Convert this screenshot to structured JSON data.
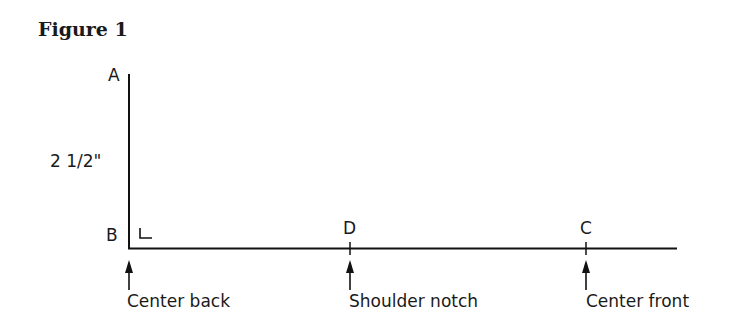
{
  "figure": {
    "title": "Figure 1",
    "points": {
      "a": "A",
      "b": "B",
      "c": "C",
      "d": "D"
    },
    "measurement": "2 1/2\"",
    "annotations": {
      "center_back": "Center back",
      "shoulder_notch": "Shoulder notch",
      "center_front": "Center front"
    }
  }
}
